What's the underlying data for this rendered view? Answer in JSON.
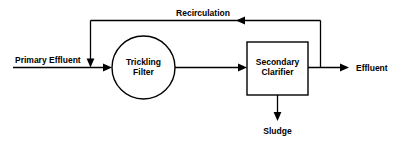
{
  "diagram": {
    "background_color": "#ffffff",
    "line_color": "#000000",
    "text_color": "#000000",
    "nodes": [
      {
        "id": "trickling-filter",
        "shape": "circle",
        "label_line1": "Trickling",
        "label_line2": "Filter"
      },
      {
        "id": "secondary-clarifier",
        "shape": "rectangle",
        "label_line1": "Secondary",
        "label_line2": "Clarifier"
      }
    ],
    "edge_labels": {
      "inlet": "Primary Effluent",
      "recirculation": "Recirculation",
      "outlet": "Effluent",
      "sludge": "Sludge"
    }
  }
}
